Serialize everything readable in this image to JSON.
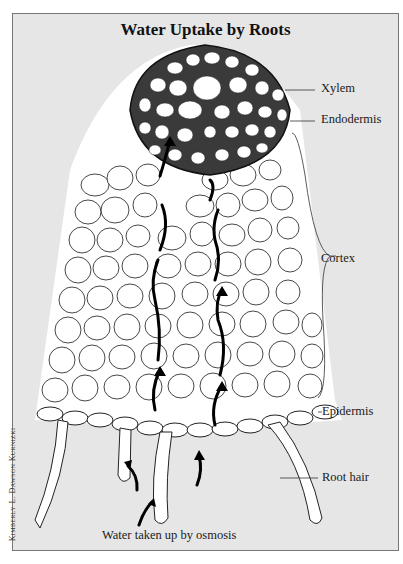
{
  "figure": {
    "title": "Water Uptake by Roots",
    "credit": "Kimberly L. Dawson Kurnizki",
    "caption_bottom": "Water taken up by osmosis",
    "labels": {
      "xylem": "Xylem",
      "endodermis": "Endodermis",
      "cortex": "Cortex",
      "epidermis": "Epidermis",
      "root_hair": "Root hair"
    },
    "colors": {
      "background": "#e6e6e6",
      "frame_border": "#777777",
      "cell_fill": "#ffffff",
      "cell_outline": "#222222",
      "arrow": "#000000"
    }
  }
}
